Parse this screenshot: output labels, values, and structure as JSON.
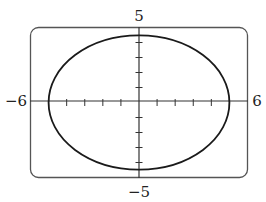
{
  "chart_data": {
    "type": "line",
    "title": "",
    "xlabel": "",
    "ylabel": "",
    "xlim": [
      -6,
      6
    ],
    "ylim": [
      -5,
      5
    ],
    "x_tick_step": 1,
    "y_tick_step": 1,
    "grid": false,
    "tick_labels": {
      "xmin": "−6",
      "xmax": "6",
      "ymin": "−5",
      "ymax": "5"
    },
    "series": [
      {
        "name": "ellipse",
        "shape": "ellipse",
        "center": [
          0,
          0
        ],
        "semi_axis_x": 5,
        "semi_axis_y": 4.47,
        "equation": "x^2/25 + y^2/20 = 1"
      }
    ]
  },
  "colors": {
    "curve": "#1a1a1a",
    "axis": "#333333",
    "frame": "#555555"
  }
}
